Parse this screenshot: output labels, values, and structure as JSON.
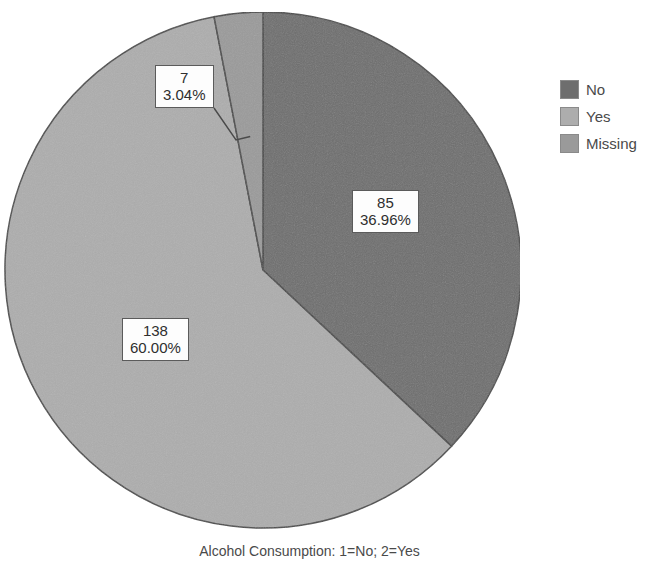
{
  "chart_data": {
    "type": "pie",
    "title": "",
    "subtitle": "",
    "xlabel": "Alcohol Consumption: 1=No; 2=Yes",
    "ylabel": "",
    "total": 230,
    "legend_position": "right",
    "grid": false,
    "start_angle_deg": 0,
    "direction": "clockwise",
    "categories": [
      "No",
      "Yes",
      "Missing"
    ],
    "values": [
      85,
      138,
      7
    ],
    "percents": [
      36.96,
      60.0,
      3.04
    ],
    "colors": [
      "#6e6e6e",
      "#adadad",
      "#9a9a9a"
    ],
    "slices": [
      {
        "label": "No",
        "value": 85,
        "percent": "36.96%",
        "value_text": "85",
        "color": "#6e6e6e",
        "start_deg": 0,
        "end_deg": 133.06
      },
      {
        "label": "Yes",
        "value": 138,
        "percent": "60.00%",
        "value_text": "138",
        "color": "#adadad",
        "start_deg": 133.06,
        "end_deg": 349.06
      },
      {
        "label": "Missing",
        "value": 7,
        "percent": "3.04%",
        "value_text": "7",
        "color": "#9a9a9a",
        "start_deg": 349.06,
        "end_deg": 360
      }
    ]
  },
  "legend": {
    "items": [
      {
        "label": "No",
        "color": "#6e6e6e"
      },
      {
        "label": "Yes",
        "color": "#adadad"
      },
      {
        "label": "Missing",
        "color": "#9a9a9a"
      }
    ]
  },
  "labels": {
    "no": {
      "value": "85",
      "percent": "36.96%"
    },
    "yes": {
      "value": "138",
      "percent": "60.00%"
    },
    "missing": {
      "value": "7",
      "percent": "3.04%"
    }
  },
  "caption": {
    "text": "Alcohol Consumption: 1=No; 2=Yes"
  }
}
